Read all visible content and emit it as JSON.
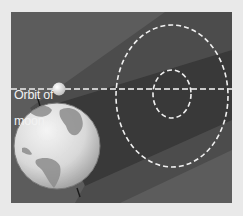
{
  "diagram": {
    "labels": {
      "orbit_of_moon_line1": "Orbit of",
      "orbit_of_moon_line2": "moon"
    },
    "elements": {
      "earth": "earth-globe",
      "moon": "moon",
      "moon_orbit": "dashed-orbit-line",
      "penumbra": "penumbral-shadow-outer-dashed-ellipse",
      "umbra": "umbral-shadow-inner-dashed-ellipse"
    },
    "colors": {
      "page_background": "#e9e9e9",
      "panel_background": "#5c5c5c",
      "penumbra_cone": "#4a4a4a",
      "umbra_cone": "#363636",
      "dashed_lines": "#f0f0f0",
      "orbit_line": "#c8c8c8",
      "earth_ocean": "#dcdcdc",
      "earth_land": "#8a8a8a",
      "moon": "#eeeeee"
    }
  }
}
